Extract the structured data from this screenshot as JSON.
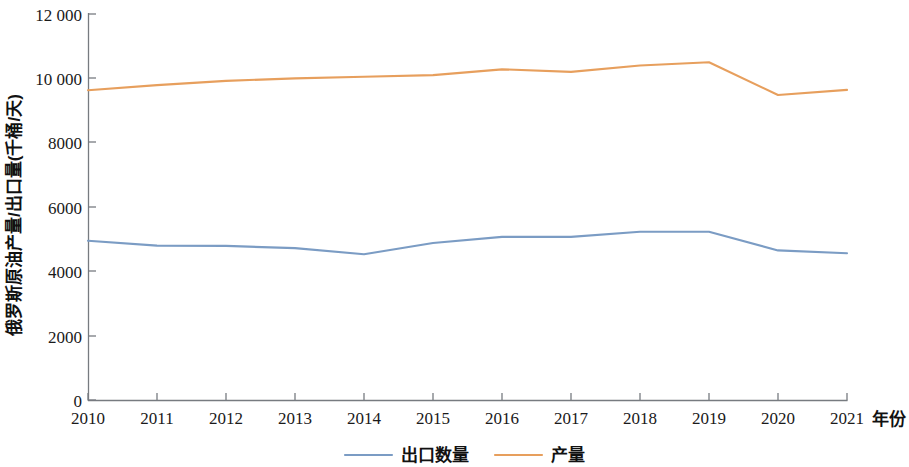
{
  "chart_data": {
    "type": "line",
    "title": "",
    "xlabel": "年份",
    "ylabel": "俄罗斯原油产量/出口量(千桶/天)",
    "categories": [
      "2010",
      "2011",
      "2012",
      "2013",
      "2014",
      "2015",
      "2016",
      "2017",
      "2018",
      "2019",
      "2020",
      "2021"
    ],
    "x": [
      2010,
      2011,
      2012,
      2013,
      2014,
      2015,
      2016,
      2017,
      2018,
      2019,
      2020,
      2021
    ],
    "series": [
      {
        "name": "出口数量",
        "color": "#7b9cc4",
        "values": [
          4950,
          4800,
          4790,
          4720,
          4530,
          4880,
          5070,
          5070,
          5230,
          5230,
          4650,
          4560
        ]
      },
      {
        "name": "产量",
        "color": "#e79f5d",
        "values": [
          9630,
          9790,
          9920,
          10000,
          10050,
          10100,
          10280,
          10200,
          10400,
          10500,
          9480,
          9640
        ]
      }
    ],
    "ylim": [
      0,
      12000
    ],
    "xlim": [
      2010,
      2021
    ],
    "yticks": [
      0,
      2000,
      4000,
      6000,
      8000,
      10000,
      12000
    ],
    "ytick_labels": [
      "0",
      "2000",
      "4000",
      "6000",
      "8000",
      "10 000",
      "12 000"
    ],
    "xticks": [
      2010,
      2011,
      2012,
      2013,
      2014,
      2015,
      2016,
      2017,
      2018,
      2019,
      2020,
      2021
    ],
    "xtick_labels": [
      "2010",
      "2011",
      "2012",
      "2013",
      "2014",
      "2015",
      "2016",
      "2017",
      "2018",
      "2019",
      "2020",
      "2021"
    ],
    "grid": false,
    "legend_position": "bottom",
    "legend_entries": [
      {
        "label": "出口数量",
        "color": "#7b9cc4"
      },
      {
        "label": "产量",
        "color": "#e79f5d"
      }
    ]
  },
  "axes": {
    "y_axis_title": "俄罗斯原油产量/出口量(千桶/天)",
    "x_axis_title": "年份"
  }
}
